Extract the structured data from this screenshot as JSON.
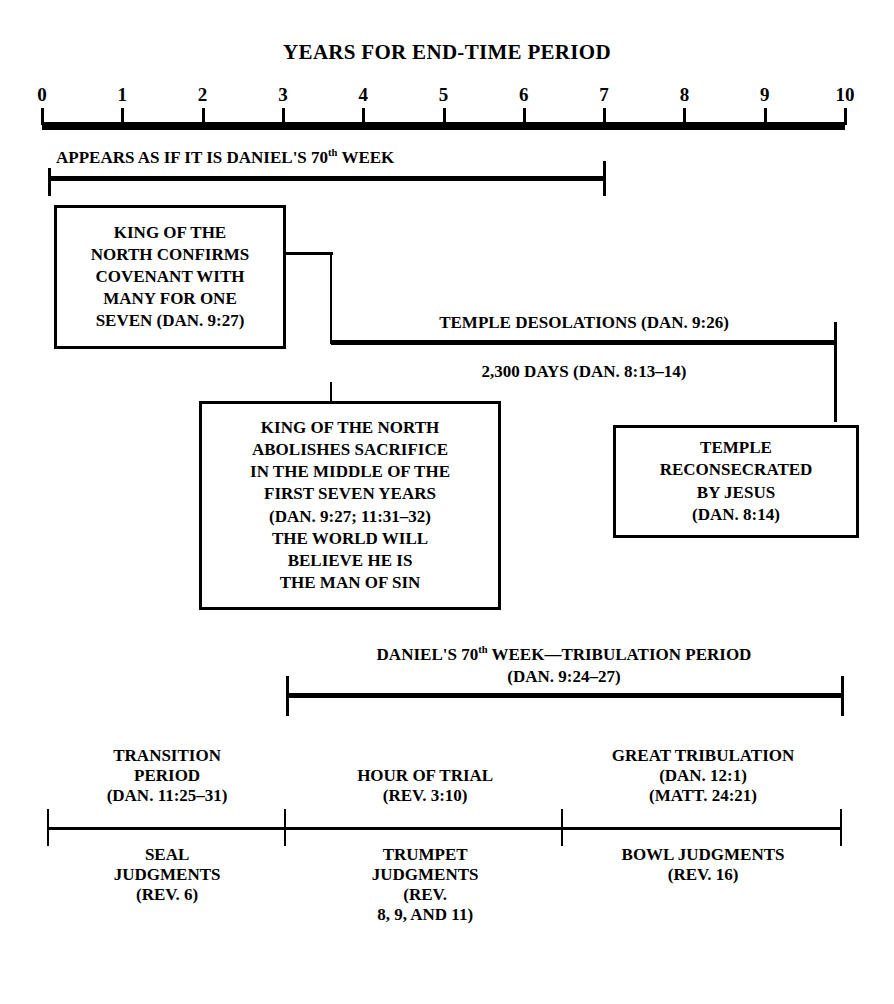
{
  "title": "YEARS FOR END-TIME PERIOD",
  "axis": {
    "labels": [
      "0",
      "1",
      "2",
      "3",
      "4",
      "5",
      "6",
      "7",
      "8",
      "9",
      "10"
    ],
    "min": 0,
    "max": 10,
    "units": "years"
  },
  "bars": {
    "appears_as_if": {
      "label_prefix": "APPEARS AS IF IT IS DANIEL'S 70",
      "label_sup": "th",
      "label_suffix": " WEEK",
      "start_year": 0,
      "end_year": 7
    },
    "temple_desolations": {
      "label": "TEMPLE DESOLATIONS (DAN. 9:26)",
      "start_year": 3.5,
      "end_year": 10
    },
    "days_2300": {
      "label": "2,300 DAYS (DAN. 8:13–14)",
      "start_year": 3.5,
      "end_year": 10
    },
    "tribulation": {
      "label_prefix": "DANIEL'S 70",
      "label_sup": "th",
      "label_suffix": " WEEK—TRIBULATION PERIOD",
      "label_line2": "(DAN. 9:24–27)",
      "start_year": 3,
      "end_year": 10
    },
    "judgments_axis": {
      "start_year": 0,
      "end_year": 10,
      "divider_years": [
        3,
        6.5
      ]
    }
  },
  "boxes": {
    "king_confirms": {
      "lines": [
        "KING OF THE",
        "NORTH CONFIRMS",
        "COVENANT WITH",
        "MANY FOR ONE",
        "SEVEN (DAN. 9:27)"
      ]
    },
    "king_abolishes": {
      "lines": [
        "KING OF THE NORTH",
        "ABOLISHES SACRIFICE",
        "IN THE MIDDLE OF THE",
        "FIRST SEVEN YEARS",
        "(DAN. 9:27; 11:31–32)",
        "THE WORLD WILL",
        "BELIEVE HE IS",
        "THE MAN OF SIN"
      ]
    },
    "temple_reconsecrated": {
      "lines": [
        "TEMPLE",
        "RECONSECRATED",
        "BY JESUS",
        "(DAN. 8:14)"
      ]
    }
  },
  "periods_above": [
    {
      "name": "transition-period",
      "lines": [
        "TRANSITION",
        "PERIOD",
        "(DAN. 11:25–31)"
      ],
      "center_year": 1.5
    },
    {
      "name": "hour-of-trial",
      "lines": [
        "HOUR OF TRIAL",
        "(REV. 3:10)"
      ],
      "center_year": 4.75
    },
    {
      "name": "great-tribulation",
      "lines": [
        "GREAT TRIBULATION",
        "(DAN. 12:1)",
        "(MATT. 24:21)"
      ],
      "center_year": 8.25
    }
  ],
  "periods_below": [
    {
      "name": "seal-judgments",
      "lines": [
        "SEAL",
        "JUDGMENTS",
        "(REV. 6)"
      ],
      "center_year": 1.5
    },
    {
      "name": "trumpet-judgments",
      "lines": [
        "TRUMPET",
        "JUDGMENTS",
        "(REV.",
        "8, 9, AND 11)"
      ],
      "center_year": 4.75
    },
    {
      "name": "bowl-judgments",
      "lines": [
        "BOWL JUDGMENTS",
        "(REV. 16)"
      ],
      "center_year": 8.25
    }
  ],
  "colors": {
    "ink": "#000000",
    "paper": "#ffffff"
  }
}
